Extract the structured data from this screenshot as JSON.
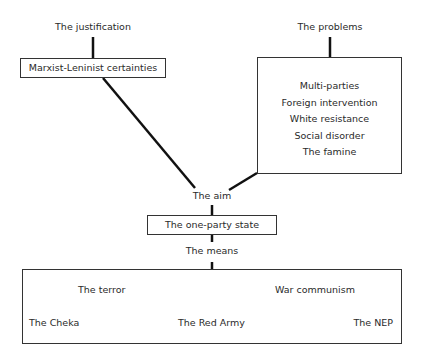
{
  "diagram": {
    "justification": {
      "label": "The justification",
      "box": "Marxist-Leninist certainties"
    },
    "problems": {
      "label": "The problems",
      "items": [
        "Multi-parties",
        "Foreign intervention",
        "White resistance",
        "Social disorder",
        "The famine"
      ]
    },
    "aim": {
      "label": "The aim",
      "box": "The one-party state"
    },
    "means": {
      "label": "The means",
      "items": [
        "The terror",
        "War communism",
        "The Cheka",
        "The Red Army",
        "The NEP"
      ]
    },
    "colors": {
      "line": "#111111",
      "border": "#333333",
      "text": "#2a2a2a"
    }
  }
}
